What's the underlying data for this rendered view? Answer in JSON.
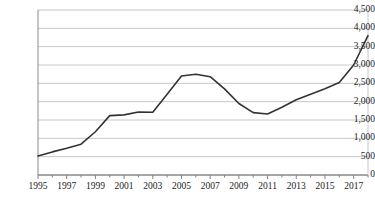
{
  "chart_data": {
    "type": "line",
    "title": "",
    "subtitle": "",
    "xlabel": "",
    "ylabel": "",
    "legend": [],
    "legend_position": "none",
    "grid": true,
    "grid_axis": "y",
    "line_color": "#333333",
    "grid_color": "#c8c8c8",
    "axis_color": "#808080",
    "background": "#ffffff",
    "xlim": [
      1995,
      2018
    ],
    "ylim": [
      0,
      4500
    ],
    "yticks": [
      0,
      500,
      1000,
      1500,
      2000,
      2500,
      3000,
      3500,
      4000,
      4500
    ],
    "ytick_labels": [
      "0",
      "500",
      "1,000",
      "1,500",
      "2,000",
      "2,500",
      "3,000",
      "3,500",
      "4,000",
      "4,500"
    ],
    "xticks": [
      1995,
      1996,
      1997,
      1998,
      1999,
      2000,
      2001,
      2002,
      2003,
      2004,
      2005,
      2006,
      2007,
      2008,
      2009,
      2010,
      2011,
      2012,
      2013,
      2014,
      2015,
      2016,
      2017,
      2018
    ],
    "xtick_labels_shown": [
      "1995",
      "1997",
      "1999",
      "2001",
      "2003",
      "2005",
      "2007",
      "2009",
      "2011",
      "2013",
      "2015",
      "2017"
    ],
    "x": [
      1995,
      1996,
      1997,
      1998,
      1999,
      2000,
      2001,
      2002,
      2003,
      2004,
      2005,
      2006,
      2007,
      2008,
      2009,
      2010,
      2011,
      2012,
      2013,
      2014,
      2015,
      2016,
      2017,
      2018
    ],
    "values": [
      520,
      630,
      730,
      840,
      1180,
      1620,
      1640,
      1720,
      1710,
      2200,
      2700,
      2750,
      2680,
      2350,
      1950,
      1700,
      1665,
      1850,
      2050,
      2200,
      2350,
      2520,
      3000,
      3800
    ],
    "series": [
      {
        "name": "",
        "values": [
          520,
          630,
          730,
          840,
          1180,
          1620,
          1640,
          1720,
          1710,
          2200,
          2700,
          2750,
          2680,
          2350,
          1950,
          1700,
          1665,
          1850,
          2050,
          2200,
          2350,
          2520,
          3000,
          3800
        ]
      }
    ]
  }
}
